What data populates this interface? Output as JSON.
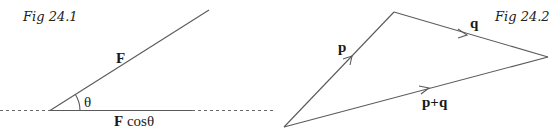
{
  "figure_1": {
    "caption": "Fig 24.1",
    "vector_label": "F",
    "angle_label": "θ",
    "component_label_bold": "F",
    "component_label_rest": " cosθ",
    "colors": {
      "line": "#5a5a5a",
      "text": "#1a1a1a"
    }
  },
  "figure_2": {
    "caption": "Fig 24.2",
    "vector_p_label": "p",
    "vector_q_label": "q",
    "resultant_label": "p+q",
    "colors": {
      "line": "#5a5a5a",
      "text": "#1a1a1a"
    }
  }
}
